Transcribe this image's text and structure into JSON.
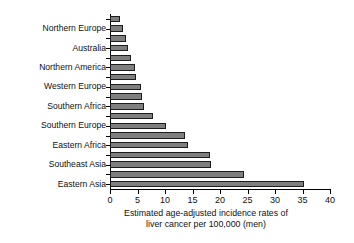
{
  "chart_data": {
    "type": "bar",
    "orientation": "horizontal",
    "title": "",
    "xlabel": "Estimated age-adjusted incidence rates of liver cancer per 100,000 (men)",
    "xlabel_lines": [
      "Estimated age-adjusted incidence rates of",
      "liver cancer per 100,000 (men)"
    ],
    "ylabel": "",
    "xlim": [
      0,
      40
    ],
    "xticks": [
      0,
      5,
      10,
      15,
      20,
      25,
      30,
      35,
      40
    ],
    "xtick_labels": [
      "0",
      "5",
      "10",
      "15",
      "20",
      "25",
      "30",
      "35",
      "40"
    ],
    "grid": false,
    "legend": false,
    "bar_color": "#7f7f7f",
    "bar_edge_color": "#1d1d1d",
    "axis_color": "#000000",
    "background": "#ffffff",
    "categories": [
      "",
      "Northern Europe",
      "",
      "Australia",
      "",
      "Northern America",
      "",
      "Western Europe",
      "",
      "Southern Africa",
      "",
      "Southern Europe",
      "",
      "Eastern Africa",
      "",
      "Southeast Asia",
      "",
      "Eastern Asia"
    ],
    "visible_tick_labels": [
      "Northern Europe",
      "Australia",
      "Northern America",
      "Western Europe",
      "Southern Africa",
      "Southern Europe",
      "Eastern Africa",
      "Southeast Asia",
      "Eastern Asia"
    ],
    "values": [
      1.9,
      2.4,
      2.9,
      3.3,
      3.9,
      4.6,
      4.7,
      5.7,
      5.8,
      6.2,
      7.8,
      10.1,
      13.6,
      14.2,
      18.2,
      18.4,
      24.3,
      35.2
    ],
    "n_bars": 18
  }
}
